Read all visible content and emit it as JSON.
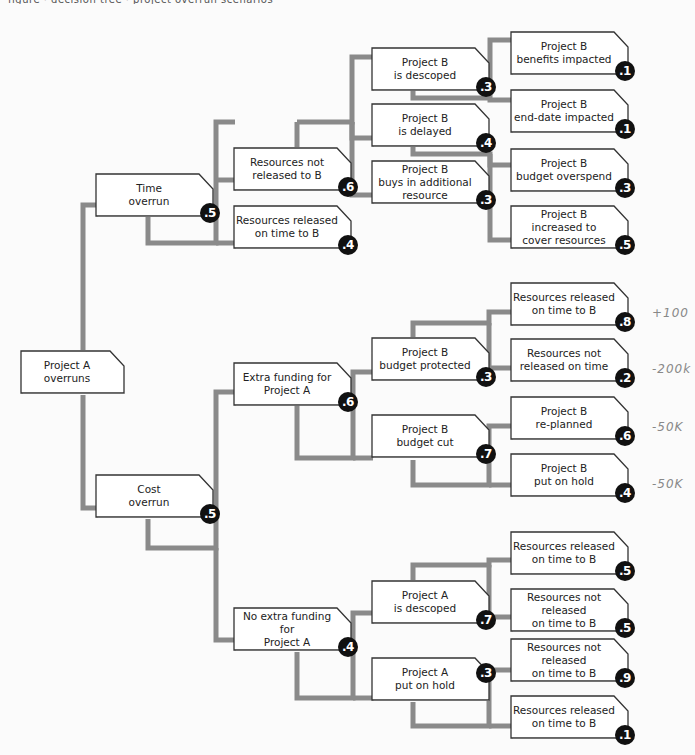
{
  "caption": "figure · decision tree · project overrun scenarios",
  "colors": {
    "connector": "#8a8a8a",
    "node_fill": "#ffffff",
    "node_border": "#333333",
    "badge_fill": "#111111",
    "badge_text": "#ffffff",
    "annotation": "#888888"
  },
  "tree": {
    "root": {
      "label": "Project A\noverruns"
    },
    "nodes": [
      {
        "id": "time-overrun",
        "label": "Time\noverrun",
        "probability": ".5"
      },
      {
        "id": "cost-overrun",
        "label": "Cost\noverrun",
        "probability": ".5"
      },
      {
        "id": "resources-not-released-to-b",
        "label": "Resources not\nreleased to B",
        "probability": ".6"
      },
      {
        "id": "resources-released-on-time-to-b",
        "label": "Resources released\non time to B",
        "probability": ".4"
      },
      {
        "id": "extra-funding-for-a",
        "label": "Extra funding for\nProject A",
        "probability": ".6"
      },
      {
        "id": "no-extra-funding-for-a",
        "label": "No extra funding for\nProject A",
        "probability": ".4"
      },
      {
        "id": "b-is-descoped",
        "label": "Project B\nis descoped",
        "probability": ".3"
      },
      {
        "id": "b-is-delayed",
        "label": "Project B\nis delayed",
        "probability": ".4"
      },
      {
        "id": "b-buys-additional-resource",
        "label": "Project B\nbuys in additional\nresource",
        "probability": ".3"
      },
      {
        "id": "b-budget-protected",
        "label": "Project B\nbudget protected",
        "probability": ".3"
      },
      {
        "id": "b-budget-cut",
        "label": "Project B\nbudget cut",
        "probability": ".7"
      },
      {
        "id": "a-is-descoped",
        "label": "Project A\nis descoped",
        "probability": ".7"
      },
      {
        "id": "a-put-on-hold",
        "label": "Project A\nput on hold",
        "probability": ".3"
      },
      {
        "id": "b-benefits-impacted",
        "label": "Project B\nbenefits impacted",
        "probability": ".1"
      },
      {
        "id": "b-end-date-impacted",
        "label": "Project B\nend-date impacted",
        "probability": ".1"
      },
      {
        "id": "b-budget-overspend",
        "label": "Project B\nbudget overspend",
        "probability": ".3"
      },
      {
        "id": "b-increased-to-cover",
        "label": "Project B\nincreased to\ncover resources",
        "probability": ".5"
      },
      {
        "id": "res-released-on-time-1",
        "label": "Resources released\non time to B",
        "probability": ".8"
      },
      {
        "id": "res-not-released-on-time-1",
        "label": "Resources not\nreleased on time",
        "probability": ".2"
      },
      {
        "id": "b-re-planned",
        "label": "Project B\nre-planned",
        "probability": ".6"
      },
      {
        "id": "b-put-on-hold",
        "label": "Project B\nput on hold",
        "probability": ".4"
      },
      {
        "id": "res-released-on-time-2",
        "label": "Resources released\non time to B",
        "probability": ".5"
      },
      {
        "id": "res-not-released-on-time-2",
        "label": "Resources not\nreleased\non time to B",
        "probability": ".5"
      },
      {
        "id": "res-not-released-on-time-3",
        "label": "Resources not\nreleased\non time to B",
        "probability": ".9"
      },
      {
        "id": "res-released-on-time-3",
        "label": "Resources released\non time to B",
        "probability": ".1"
      }
    ]
  },
  "annotations": [
    {
      "for": "res-released-on-time-1",
      "text": "+100"
    },
    {
      "for": "res-not-released-on-time-1",
      "text": "-200k"
    },
    {
      "for": "b-re-planned",
      "text": "-50K"
    },
    {
      "for": "b-put-on-hold",
      "text": "-50K"
    }
  ]
}
